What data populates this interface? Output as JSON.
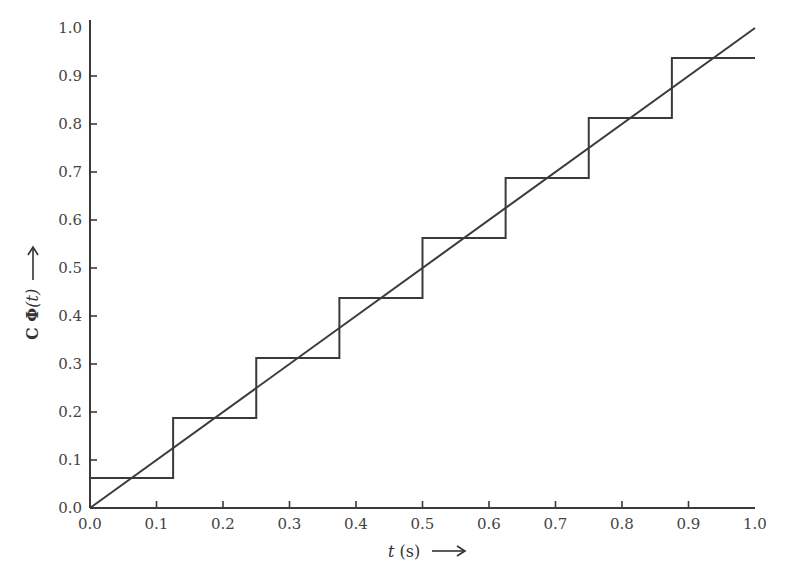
{
  "chart_data": {
    "type": "line",
    "title": "",
    "xlabel": "t (s) →",
    "ylabel": "C Φ(t) →",
    "xlim": [
      0.0,
      1.0
    ],
    "ylim": [
      0.0,
      1.0
    ],
    "grid": false,
    "legend": null,
    "x_ticks": [
      "0.0",
      "0.1",
      "0.2",
      "0.3",
      "0.4",
      "0.5",
      "0.6",
      "0.7",
      "0.8",
      "0.9",
      "1.0"
    ],
    "y_ticks": [
      "0.0",
      "0.1",
      "0.2",
      "0.3",
      "0.4",
      "0.5",
      "0.6",
      "0.7",
      "0.8",
      "0.9",
      "1.0"
    ],
    "series": [
      {
        "name": "ramp f(t) = t",
        "kind": "line",
        "x": [
          0.0,
          1.0
        ],
        "y": [
          0.0,
          1.0
        ]
      },
      {
        "name": "block-pulse approximation CΦ(t)",
        "kind": "step",
        "breaks": [
          0.0,
          0.125,
          0.25,
          0.375,
          0.5,
          0.625,
          0.75,
          0.875,
          1.0
        ],
        "values": [
          0.0625,
          0.1875,
          0.3125,
          0.4375,
          0.5625,
          0.6875,
          0.8125,
          0.9375
        ]
      }
    ]
  },
  "axis": {
    "x_title_var": "t",
    "x_title_unit": " (s)",
    "y_title_prefix": "C ",
    "y_title_phi": "Φ",
    "y_title_arg": "(t)",
    "arrow": "→"
  },
  "colors": {
    "line": "#3a3a3a",
    "axis": "#3a3a3a",
    "text": "#444444"
  }
}
